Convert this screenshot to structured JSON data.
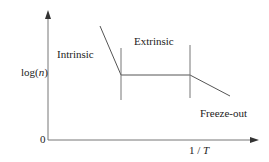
{
  "diagram": {
    "y_axis_label": "log(",
    "y_axis_var": "n",
    "y_axis_close": ")",
    "x_axis_label_num": "1 / ",
    "x_axis_var": "T",
    "origin_label": "0",
    "regions": {
      "intrinsic": "Intrinsic",
      "extrinsic": "Extrinsic",
      "freeze_out": "Freeze-out"
    },
    "colors": {
      "line": "#555555",
      "axis": "#666666",
      "text": "#222222"
    }
  }
}
